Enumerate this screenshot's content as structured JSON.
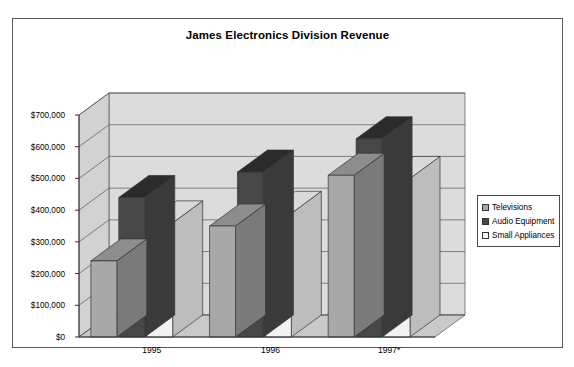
{
  "chart_data": {
    "type": "bar",
    "title": "James Electronics Division Revenue",
    "xlabel": "",
    "ylabel": "",
    "categories": [
      "1995",
      "1996",
      "1997*"
    ],
    "series": [
      {
        "name": "Televisions",
        "values": [
          240000,
          350000,
          510000
        ],
        "color": "#a8a8a8"
      },
      {
        "name": "Audio Equipment",
        "values": [
          440000,
          520000,
          625000
        ],
        "color": "#474747"
      },
      {
        "name": "Small Appliances",
        "values": [
          360000,
          390000,
          500000
        ],
        "color": "#f2f2f2"
      }
    ],
    "ylim": [
      0,
      700000
    ],
    "ytick_step": 100000,
    "ytick_labels": [
      "$700,000",
      "$600,000",
      "$500,000",
      "$400,000",
      "$300,000",
      "$200,000",
      "$100,000",
      "$0"
    ],
    "grid": true,
    "legend_position": "right",
    "three_d": true
  },
  "legend": {
    "items": [
      {
        "label": "Televisions"
      },
      {
        "label": "Audio Equipment"
      },
      {
        "label": "Small Appliances"
      }
    ]
  }
}
